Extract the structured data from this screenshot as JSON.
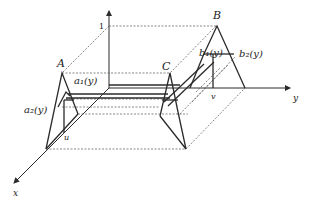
{
  "diagram": {
    "axes": {
      "vertical_tick_label": "1",
      "x_label": "x",
      "y_label": "y"
    },
    "points": {
      "A": "A",
      "B": "B",
      "C": "C"
    },
    "functions": {
      "a1": "a₁(y)",
      "a2": "a₂(y)",
      "b1": "b₁(y)",
      "b2": "b₂(y)"
    },
    "markers": {
      "u": "u",
      "v": "v"
    },
    "colors": {
      "ink": "#2b2b2b",
      "background": "#ffffff"
    }
  }
}
